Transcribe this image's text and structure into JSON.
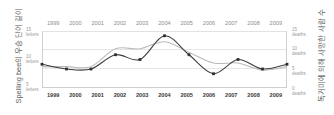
{
  "chart_data": {
    "type": "line",
    "title": "",
    "subtitle": "",
    "xlabel": "",
    "grid": true,
    "legend_position": "none",
    "x": [
      1999,
      2000,
      2001,
      2002,
      2003,
      2004,
      2005,
      2006,
      2007,
      2008,
      2009
    ],
    "categories": [
      "1999",
      "2000",
      "2001",
      "2002",
      "2003",
      "2004",
      "2005",
      "2006",
      "2007",
      "2008",
      "2009"
    ],
    "axes": {
      "left": {
        "title": "Spelling bee의 우승 단어 길이",
        "unit": "letters",
        "ticks": [
          {
            "value": 15,
            "num": "15",
            "unit": "letters"
          },
          {
            "value": 10,
            "num": "10",
            "unit": "letters"
          },
          {
            "value": 5,
            "num": "5",
            "unit": "letters"
          }
        ],
        "ylim": [
          4,
          16
        ]
      },
      "right": {
        "title": "독거미에 의해 사망한 사람 수",
        "unit": "deaths",
        "ticks": [
          {
            "value": 15,
            "num": "15",
            "unit": "deaths"
          },
          {
            "value": 10,
            "num": "10",
            "unit": "deaths"
          },
          {
            "value": 5,
            "num": "5",
            "unit": "deaths"
          },
          {
            "value": 0,
            "num": "0",
            "unit": "deaths"
          }
        ],
        "ylim": [
          0,
          16
        ]
      }
    },
    "series": [
      {
        "name": "Spelling bee의 우승 단어 길이",
        "axis": "left",
        "unit": "letters",
        "color": "#3c3c3c",
        "marker": "square",
        "values": [
          9,
          8,
          8,
          11,
          10,
          15,
          11,
          7,
          10,
          8,
          9
        ]
      },
      {
        "name": "독거미에 의해 사망한 사람 수",
        "axis": "right",
        "unit": "deaths",
        "color": "#b9b9b9",
        "marker": "none",
        "values": [
          6,
          6,
          6,
          11,
          11,
          13,
          10,
          7,
          7,
          5,
          6
        ]
      }
    ]
  },
  "years_top": [
    "1999",
    "2000",
    "2001",
    "2002",
    "2003",
    "2004",
    "2005",
    "2006",
    "2007",
    "2008",
    "2009"
  ],
  "years_bottom": [
    "1999",
    "2000",
    "2001",
    "2002",
    "2003",
    "2004",
    "2005",
    "2006",
    "2007",
    "2008",
    "2009"
  ]
}
